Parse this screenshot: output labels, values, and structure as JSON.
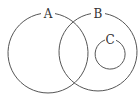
{
  "diagram": {
    "type": "venn",
    "sets": [
      {
        "label": "A",
        "cx": 48,
        "cy": 52,
        "r": 40
      },
      {
        "label": "B",
        "cx": 98,
        "cy": 52,
        "r": 39
      },
      {
        "label": "C",
        "cx": 110,
        "cy": 54,
        "r": 15
      }
    ],
    "relationships": [
      "A overlaps B",
      "C is a subset of B",
      "C is disjoint from A"
    ],
    "stroke_color": "#555555"
  }
}
